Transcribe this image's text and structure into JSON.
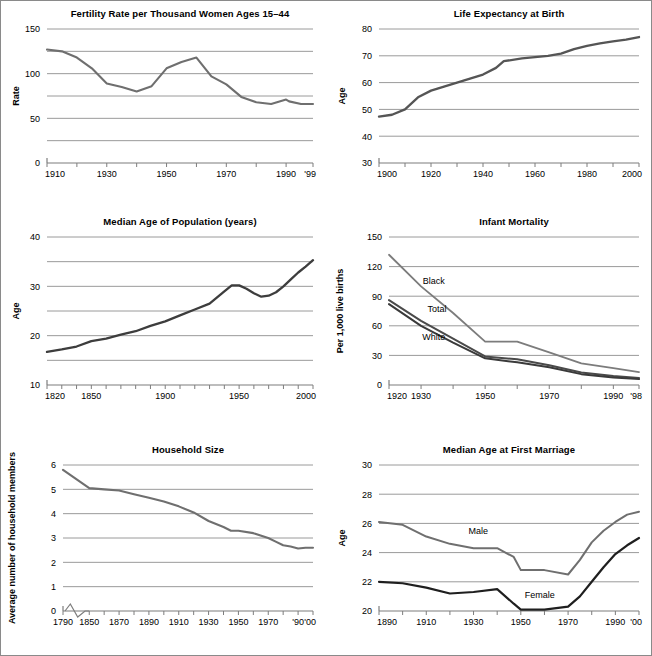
{
  "figure": {
    "border_color": "#8a8a8a",
    "background": "#ffffff",
    "grid_color": "#9a9a9a",
    "axis_color": "#7d7d7d",
    "dark_line": "#3a3a3a",
    "light_line": "#7c7c7c"
  },
  "charts": [
    {
      "id": "fertility-rate",
      "title": "Fertility Rate per Thousand Women Ages 15–44",
      "ylabel": "Rate",
      "xlabel": "",
      "type": "line",
      "xlim": [
        1910,
        1999
      ],
      "ylim": [
        0,
        150
      ],
      "ygrid": [
        25,
        50,
        75,
        100,
        125,
        150
      ],
      "yticks": [
        0,
        50,
        100,
        150
      ],
      "ytick_labels": [
        "0",
        "50",
        "100",
        "150"
      ],
      "xticks": [
        1910,
        1920,
        1930,
        1940,
        1950,
        1960,
        1970,
        1980,
        1990,
        1999
      ],
      "xtick_labels": [
        {
          "x": 1910,
          "label": "1910"
        },
        {
          "x": 1930,
          "label": "1930"
        },
        {
          "x": 1950,
          "label": "1950"
        },
        {
          "x": 1970,
          "label": "1970"
        },
        {
          "x": 1990,
          "label": "1990"
        },
        {
          "x": 1999,
          "label": "'99"
        }
      ],
      "series": [
        {
          "name": "Fertility rate",
          "color": "#6f6f6f",
          "width": 2.1,
          "x": [
            1910,
            1915,
            1920,
            1925,
            1930,
            1935,
            1940,
            1945,
            1950,
            1955,
            1960,
            1965,
            1970,
            1975,
            1980,
            1985,
            1990,
            1991,
            1995,
            1999
          ],
          "y": [
            127,
            125,
            118,
            106,
            89,
            85,
            80,
            86,
            106,
            113,
            118,
            97,
            88,
            74,
            68,
            66,
            71,
            69,
            66,
            66
          ]
        }
      ]
    },
    {
      "id": "life-expectancy",
      "title": "Life Expectancy at Birth",
      "ylabel": "Age",
      "xlabel": "",
      "type": "line",
      "xlim": [
        1900,
        2000
      ],
      "ylim": [
        30,
        80
      ],
      "ygrid": [
        40,
        50,
        60,
        70,
        80
      ],
      "yticks": [
        30,
        40,
        50,
        60,
        70,
        80
      ],
      "ytick_labels": [
        "30",
        "40",
        "50",
        "60",
        "70",
        "80"
      ],
      "xticks": [
        1900,
        1910,
        1920,
        1930,
        1940,
        1950,
        1960,
        1970,
        1980,
        1990,
        2000
      ],
      "xtick_labels": [
        {
          "x": 1900,
          "label": "1900"
        },
        {
          "x": 1920,
          "label": "1920"
        },
        {
          "x": 1940,
          "label": "1940"
        },
        {
          "x": 1960,
          "label": "1960"
        },
        {
          "x": 1980,
          "label": "1980"
        },
        {
          "x": 2000,
          "label": "2000"
        }
      ],
      "series": [
        {
          "name": "Life expectancy",
          "color": "#555555",
          "width": 2.3,
          "x": [
            1900,
            1905,
            1910,
            1915,
            1920,
            1925,
            1930,
            1935,
            1940,
            1945,
            1948,
            1955,
            1960,
            1965,
            1970,
            1975,
            1980,
            1985,
            1990,
            1995,
            2000
          ],
          "y": [
            47.3,
            48.0,
            50.0,
            54.5,
            57.0,
            58.5,
            60.0,
            61.5,
            63.0,
            65.5,
            68.0,
            69.0,
            69.5,
            70.0,
            70.8,
            72.5,
            73.7,
            74.6,
            75.4,
            76.0,
            77.0
          ]
        }
      ]
    },
    {
      "id": "median-age-population",
      "title": "Median Age of Population (years)",
      "ylabel": "Age",
      "xlabel": "",
      "type": "line",
      "xlim": [
        1820,
        2000
      ],
      "ylim": [
        10,
        40
      ],
      "ygrid": [
        15,
        20,
        25,
        30,
        35,
        40
      ],
      "yticks": [
        10,
        20,
        30,
        40
      ],
      "ytick_labels": [
        "10",
        "20",
        "30",
        "40"
      ],
      "xticks": [
        1820,
        1830,
        1840,
        1850,
        1860,
        1870,
        1880,
        1890,
        1900,
        1910,
        1920,
        1930,
        1940,
        1950,
        1960,
        1970,
        1980,
        1990,
        2000
      ],
      "xtick_labels": [
        {
          "x": 1820,
          "label": "1820"
        },
        {
          "x": 1850,
          "label": "1850"
        },
        {
          "x": 1900,
          "label": "1900"
        },
        {
          "x": 1950,
          "label": "1950"
        },
        {
          "x": 2000,
          "label": "2000"
        }
      ],
      "series": [
        {
          "name": "Median age",
          "color": "#3d3d3d",
          "width": 2.3,
          "x": [
            1820,
            1830,
            1840,
            1850,
            1860,
            1870,
            1880,
            1890,
            1900,
            1910,
            1920,
            1930,
            1940,
            1945,
            1950,
            1955,
            1960,
            1965,
            1970,
            1975,
            1980,
            1985,
            1990,
            1995,
            2000
          ],
          "y": [
            16.7,
            17.2,
            17.8,
            18.9,
            19.4,
            20.2,
            20.9,
            22.0,
            22.9,
            24.1,
            25.3,
            26.5,
            29.0,
            30.2,
            30.2,
            29.5,
            28.6,
            27.9,
            28.1,
            28.8,
            30.0,
            31.4,
            32.8,
            34.0,
            35.3
          ]
        }
      ]
    },
    {
      "id": "infant-mortality",
      "title": "Infant Mortality",
      "ylabel": "Per 1,000 live births",
      "xlabel": "",
      "type": "line",
      "xlim": [
        1920,
        1998
      ],
      "ylim": [
        0,
        150
      ],
      "ygrid": [
        30,
        60,
        90,
        120,
        150
      ],
      "yticks": [
        0,
        30,
        60,
        90,
        120,
        150
      ],
      "ytick_labels": [
        "0",
        "30",
        "60",
        "90",
        "120",
        "150"
      ],
      "xticks": [
        1920,
        1930,
        1940,
        1950,
        1960,
        1970,
        1980,
        1990,
        1998
      ],
      "xtick_labels": [
        {
          "x": 1920,
          "label": "1920"
        },
        {
          "x": 1930,
          "label": "1930"
        },
        {
          "x": 1950,
          "label": "1950"
        },
        {
          "x": 1970,
          "label": "1970"
        },
        {
          "x": 1990,
          "label": "1990"
        },
        {
          "x": 1998,
          "label": "'98"
        }
      ],
      "series": [
        {
          "name": "Black",
          "color": "#7c7c7c",
          "width": 1.8,
          "label_x": 1934,
          "label_y": 102,
          "x": [
            1920,
            1930,
            1940,
            1950,
            1960,
            1970,
            1980,
            1990,
            1998
          ],
          "y": [
            132,
            100,
            73,
            44,
            44,
            33,
            22,
            17,
            13
          ]
        },
        {
          "name": "Total",
          "color": "#4a4a4a",
          "width": 2.0,
          "label_x": 1935,
          "label_y": 74,
          "x": [
            1920,
            1930,
            1940,
            1950,
            1960,
            1970,
            1980,
            1990,
            1998
          ],
          "y": [
            86,
            65,
            47,
            29,
            26,
            20,
            12.6,
            9.2,
            7.2
          ]
        },
        {
          "name": "White",
          "color": "#3a3a3a",
          "width": 2.0,
          "label_x": 1934,
          "label_y": 46,
          "x": [
            1920,
            1930,
            1940,
            1950,
            1960,
            1970,
            1980,
            1990,
            1998
          ],
          "y": [
            82,
            60,
            43,
            27,
            23,
            18,
            11,
            7.6,
            6.0
          ]
        }
      ]
    },
    {
      "id": "household-size",
      "title": "Household Size",
      "ylabel": "Average number of household members",
      "xlabel": "",
      "type": "line",
      "axis_break": true,
      "xlim": [
        1790,
        2000
      ],
      "ylim": [
        0,
        6
      ],
      "ygrid": [
        1,
        2,
        3,
        4,
        5,
        6
      ],
      "yticks": [
        0,
        1,
        2,
        3,
        4,
        5,
        6
      ],
      "ytick_labels": [
        "0",
        "1",
        "2",
        "3",
        "4",
        "5",
        "6"
      ],
      "xticks": [
        1790,
        1850,
        1860,
        1870,
        1880,
        1890,
        1900,
        1910,
        1920,
        1930,
        1940,
        1950,
        1960,
        1970,
        1980,
        1990,
        2000
      ],
      "xtick_labels": [
        {
          "x": 1790,
          "label": "1790"
        },
        {
          "x": 1850,
          "label": "1850"
        },
        {
          "x": 1870,
          "label": "1870"
        },
        {
          "x": 1890,
          "label": "1890"
        },
        {
          "x": 1910,
          "label": "1910"
        },
        {
          "x": 1930,
          "label": "1930"
        },
        {
          "x": 1950,
          "label": "1950"
        },
        {
          "x": 1970,
          "label": "1970"
        },
        {
          "x": 1990,
          "label": "'90"
        },
        {
          "x": 2000,
          "label": "'00"
        }
      ],
      "series": [
        {
          "name": "Household size",
          "color": "#6f6f6f",
          "width": 2.1,
          "x": [
            1790,
            1850,
            1860,
            1870,
            1880,
            1890,
            1900,
            1910,
            1920,
            1930,
            1940,
            1945,
            1950,
            1960,
            1970,
            1975,
            1980,
            1985,
            1990,
            1995,
            2000
          ],
          "y": [
            5.8,
            5.05,
            5.0,
            4.95,
            4.8,
            4.65,
            4.5,
            4.3,
            4.05,
            3.7,
            3.45,
            3.3,
            3.3,
            3.2,
            3.0,
            2.85,
            2.7,
            2.65,
            2.57,
            2.6,
            2.6
          ]
        }
      ]
    },
    {
      "id": "median-age-first-marriage",
      "title": "Median Age at First Marriage",
      "ylabel": "Age",
      "xlabel": "",
      "type": "line",
      "xlim": [
        1890,
        2000
      ],
      "ylim": [
        20,
        30
      ],
      "ygrid": [
        22,
        24,
        26,
        28,
        30
      ],
      "yticks": [
        20,
        22,
        24,
        26,
        28,
        30
      ],
      "ytick_labels": [
        "20",
        "22",
        "24",
        "26",
        "28",
        "30"
      ],
      "xticks": [
        1890,
        1900,
        1910,
        1920,
        1930,
        1940,
        1950,
        1960,
        1970,
        1980,
        1990,
        2000
      ],
      "xtick_labels": [
        {
          "x": 1890,
          "label": "1890"
        },
        {
          "x": 1910,
          "label": "1910"
        },
        {
          "x": 1930,
          "label": "1930"
        },
        {
          "x": 1950,
          "label": "1950"
        },
        {
          "x": 1970,
          "label": "1970"
        },
        {
          "x": 1990,
          "label": "1990"
        },
        {
          "x": 2000,
          "label": "'00"
        }
      ],
      "series": [
        {
          "name": "Male",
          "color": "#6f6f6f",
          "width": 2.0,
          "label_x": 1932,
          "label_y": 25.3,
          "x": [
            1890,
            1900,
            1910,
            1920,
            1930,
            1940,
            1947,
            1950,
            1960,
            1970,
            1975,
            1980,
            1985,
            1990,
            1995,
            2000
          ],
          "y": [
            26.1,
            25.9,
            25.1,
            24.6,
            24.3,
            24.3,
            23.7,
            22.8,
            22.8,
            22.5,
            23.5,
            24.7,
            25.5,
            26.1,
            26.6,
            26.8
          ]
        },
        {
          "name": "Female",
          "color": "#1f1f1f",
          "width": 2.2,
          "label_x": 1958,
          "label_y": 20.9,
          "x": [
            1890,
            1900,
            1910,
            1920,
            1930,
            1940,
            1947,
            1950,
            1960,
            1970,
            1975,
            1980,
            1985,
            1990,
            1995,
            2000
          ],
          "y": [
            22.0,
            21.9,
            21.6,
            21.2,
            21.3,
            21.5,
            20.5,
            20.1,
            20.1,
            20.3,
            21.0,
            22.0,
            23.0,
            23.9,
            24.5,
            25.0
          ]
        }
      ]
    }
  ]
}
